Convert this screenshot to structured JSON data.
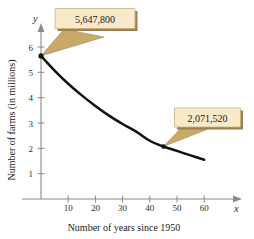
{
  "chart_data": {
    "type": "line",
    "title": "",
    "xlabel": "Number of years since 1950",
    "ylabel": "Number of farms (in millions)",
    "xlim": [
      0,
      65
    ],
    "ylim": [
      0,
      6.5
    ],
    "grid": false,
    "legend": "none",
    "x_ticks": [
      10,
      20,
      30,
      40,
      50,
      60
    ],
    "y_ticks": [
      1,
      2,
      3,
      4,
      5,
      6
    ],
    "x_axis_variable": "x",
    "y_axis_variable": "y",
    "series": [
      {
        "name": "Number of farms",
        "x": [
          0,
          5,
          10,
          15,
          20,
          25,
          30,
          35,
          40,
          45,
          50,
          55,
          60
        ],
        "values": [
          5.648,
          5.07,
          4.55,
          4.09,
          3.67,
          3.29,
          2.96,
          2.66,
          2.3,
          2.072,
          1.9,
          1.72,
          1.55
        ]
      }
    ],
    "annotations": [
      {
        "label": "5,647,800",
        "point_x": 0,
        "point_y": 5.648
      },
      {
        "label": "2,071,520",
        "point_x": 45,
        "point_y": 2.072
      }
    ],
    "colors": {
      "curve": "#111111",
      "axis": "#8a8a8a",
      "callout_fill": "#f7e9c9",
      "callout_border": "#cbb27e",
      "callout_tail": "#c9a86a",
      "text": "#1c1c1c"
    }
  },
  "x_tick_labels": {
    "t10": "10",
    "t20": "20",
    "t30": "30",
    "t40": "40",
    "t50": "50",
    "t60": "60"
  },
  "y_tick_labels": {
    "t1": "1",
    "t2": "2",
    "t3": "3",
    "t4": "4",
    "t5": "5",
    "t6": "6"
  },
  "labels": {
    "x_axis_title": "Number of years since 1950",
    "y_axis_title": "Number of farms (in millions)",
    "x_variable": "x",
    "y_variable": "y"
  },
  "callouts": {
    "top": "5,647,800",
    "bottom": "2,071,520"
  }
}
